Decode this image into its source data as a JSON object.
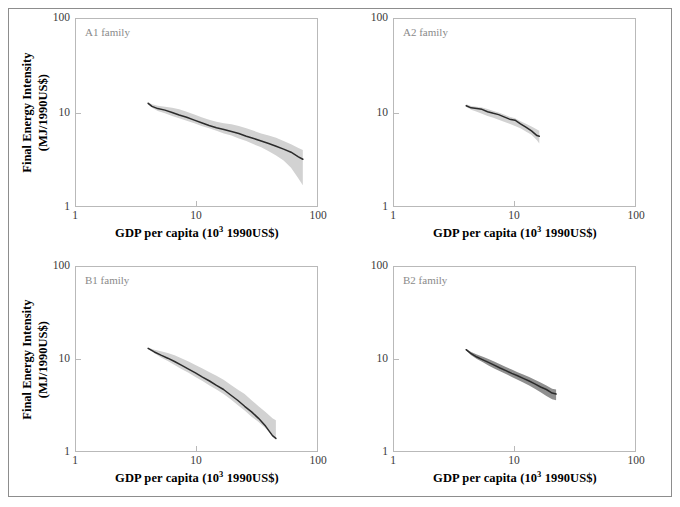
{
  "figure": {
    "axis_titles": {
      "x_main": "GDP per capita (10",
      "x_sup": "3",
      "x_tail": " 1990US$)",
      "y_line1": "Final Energy Intensity",
      "y_line2": "(MJ/1990US$)"
    },
    "tick_labels": {
      "x": [
        "1",
        "10",
        "100"
      ],
      "y": [
        "1",
        "10",
        "100"
      ]
    },
    "colors": {
      "band_light": "#d2d2d2",
      "band_dark": "#8f8f8f",
      "median_line": "#2b2b2b",
      "frame": "#b9b9b9",
      "panel_label": "#8a8a8a",
      "outer_border": "#8d8d8d"
    }
  },
  "chart_data": [
    {
      "type": "line",
      "title": "A1 family",
      "xlabel": "GDP per capita (10^3 1990US$)",
      "ylabel": "Final Energy Intensity (MJ/1990US$)",
      "xscale": "log",
      "yscale": "log",
      "xlim": [
        1,
        100
      ],
      "ylim": [
        1,
        100
      ],
      "xticks": [
        1,
        10,
        100
      ],
      "yticks": [
        1,
        10,
        100
      ],
      "grid": false,
      "legend": false,
      "band_color": "#d2d2d2",
      "series": [
        {
          "name": "median",
          "x": [
            4.0,
            4.3,
            4.8,
            5.5,
            6.3,
            7.2,
            8.3,
            9.6,
            11.0,
            12.7,
            14.6,
            16.8,
            19.4,
            22.3,
            25.7,
            29.6,
            34.1,
            39.3,
            45.2,
            52.1,
            60.0,
            69.0,
            75.0
          ],
          "values": [
            12.5,
            11.6,
            11.0,
            10.6,
            10.0,
            9.4,
            8.9,
            8.3,
            7.8,
            7.3,
            6.9,
            6.6,
            6.3,
            6.0,
            5.6,
            5.3,
            5.0,
            4.7,
            4.4,
            4.1,
            3.8,
            3.4,
            3.2
          ]
        },
        {
          "name": "upper",
          "x": [
            4.0,
            4.3,
            4.8,
            5.5,
            6.3,
            7.2,
            8.3,
            9.6,
            11.0,
            12.7,
            14.6,
            16.8,
            19.4,
            22.3,
            25.7,
            29.6,
            34.1,
            39.3,
            45.2,
            52.1,
            60.0,
            69.0,
            75.0
          ],
          "values": [
            12.8,
            12.2,
            11.8,
            11.5,
            11.2,
            10.8,
            10.2,
            9.5,
            8.9,
            8.4,
            8.0,
            7.7,
            7.5,
            7.2,
            6.8,
            6.4,
            6.0,
            5.7,
            5.4,
            5.0,
            4.6,
            4.2,
            4.0
          ]
        },
        {
          "name": "lower",
          "x": [
            4.0,
            4.3,
            4.8,
            5.5,
            6.3,
            7.2,
            8.3,
            9.6,
            11.0,
            12.7,
            14.6,
            16.8,
            19.4,
            22.3,
            25.7,
            29.6,
            34.1,
            39.3,
            45.2,
            52.1,
            60.0,
            69.0,
            75.0
          ],
          "values": [
            12.3,
            11.2,
            10.4,
            9.8,
            9.2,
            8.7,
            8.2,
            7.7,
            7.2,
            6.8,
            6.4,
            6.0,
            5.7,
            5.3,
            5.0,
            4.6,
            4.3,
            3.9,
            3.5,
            3.1,
            2.6,
            2.0,
            1.7
          ]
        }
      ]
    },
    {
      "type": "line",
      "title": "A2 family",
      "xlabel": "GDP per capita (10^3 1990US$)",
      "ylabel": "Final Energy Intensity (MJ/1990US$)",
      "xscale": "log",
      "yscale": "log",
      "xlim": [
        1,
        100
      ],
      "ylim": [
        1,
        100
      ],
      "xticks": [
        1,
        10,
        100
      ],
      "yticks": [
        1,
        10,
        100
      ],
      "grid": false,
      "legend": false,
      "band_color": "#d2d2d2",
      "series": [
        {
          "name": "median",
          "x": [
            4.0,
            4.4,
            4.9,
            5.4,
            6.0,
            6.7,
            7.4,
            8.2,
            9.1,
            10.1,
            11.2,
            12.4,
            13.8,
            15.3,
            16.0
          ],
          "values": [
            11.8,
            11.2,
            11.0,
            10.8,
            10.2,
            9.8,
            9.5,
            9.0,
            8.5,
            8.3,
            7.6,
            7.0,
            6.4,
            5.7,
            5.6
          ]
        },
        {
          "name": "upper",
          "x": [
            4.0,
            4.4,
            4.9,
            5.4,
            6.0,
            6.7,
            7.4,
            8.2,
            9.1,
            10.1,
            11.2,
            12.4,
            13.8,
            15.3,
            16.0
          ],
          "values": [
            12.2,
            11.7,
            11.5,
            11.3,
            10.9,
            10.4,
            10.0,
            9.5,
            9.0,
            8.7,
            8.1,
            7.6,
            7.1,
            6.6,
            6.4
          ]
        },
        {
          "name": "lower",
          "x": [
            4.0,
            4.4,
            4.9,
            5.4,
            6.0,
            6.7,
            7.4,
            8.2,
            9.1,
            10.1,
            11.2,
            12.4,
            13.8,
            15.3,
            16.0
          ],
          "values": [
            11.5,
            10.7,
            10.2,
            9.7,
            9.2,
            8.8,
            8.4,
            8.0,
            7.6,
            7.2,
            6.8,
            6.3,
            5.8,
            5.1,
            4.7
          ]
        }
      ]
    },
    {
      "type": "line",
      "title": "B1 family",
      "xlabel": "GDP per capita (10^3 1990US$)",
      "ylabel": "Final Energy Intensity (MJ/1990US$)",
      "xscale": "log",
      "yscale": "log",
      "xlim": [
        1,
        100
      ],
      "ylim": [
        1,
        100
      ],
      "xticks": [
        1,
        10,
        100
      ],
      "yticks": [
        1,
        10,
        100
      ],
      "grid": false,
      "legend": false,
      "band_color": "#d2d2d2",
      "series": [
        {
          "name": "median",
          "x": [
            4.0,
            4.5,
            5.1,
            5.8,
            6.6,
            7.5,
            8.6,
            9.8,
            11.2,
            12.8,
            14.6,
            16.7,
            19.1,
            21.8,
            24.9,
            28.4,
            32.4,
            37.0,
            42.2,
            45.0
          ],
          "values": [
            13.0,
            11.9,
            11.0,
            10.2,
            9.4,
            8.6,
            7.8,
            7.1,
            6.4,
            5.8,
            5.2,
            4.7,
            4.1,
            3.6,
            3.1,
            2.7,
            2.3,
            1.9,
            1.5,
            1.4
          ]
        },
        {
          "name": "upper",
          "x": [
            4.0,
            4.5,
            5.1,
            5.8,
            6.6,
            7.5,
            8.6,
            9.8,
            11.2,
            12.8,
            14.6,
            16.7,
            19.1,
            21.8,
            24.9,
            28.4,
            32.4,
            37.0,
            42.2,
            45.0
          ],
          "values": [
            13.2,
            12.6,
            12.1,
            11.6,
            11.0,
            10.2,
            9.4,
            8.6,
            7.9,
            7.2,
            6.6,
            6.0,
            5.3,
            4.7,
            4.2,
            3.6,
            3.1,
            2.7,
            2.3,
            2.2
          ]
        },
        {
          "name": "lower",
          "x": [
            4.0,
            4.5,
            5.1,
            5.8,
            6.6,
            7.5,
            8.6,
            9.8,
            11.2,
            12.8,
            14.6,
            16.7,
            19.1,
            21.8,
            24.9,
            28.4,
            32.4,
            37.0,
            42.2,
            45.0
          ],
          "values": [
            12.8,
            11.5,
            10.4,
            9.5,
            8.6,
            7.8,
            7.1,
            6.4,
            5.8,
            5.2,
            4.7,
            4.2,
            3.7,
            3.2,
            2.8,
            2.4,
            2.1,
            1.8,
            1.5,
            1.4
          ]
        }
      ]
    },
    {
      "type": "line",
      "title": "B2 family",
      "xlabel": "GDP per capita (10^3 1990US$)",
      "ylabel": "Final Energy Intensity (MJ/1990US$)",
      "xscale": "log",
      "yscale": "log",
      "xlim": [
        1,
        100
      ],
      "ylim": [
        1,
        100
      ],
      "xticks": [
        1,
        10,
        100
      ],
      "yticks": [
        1,
        10,
        100
      ],
      "grid": false,
      "legend": false,
      "band_color": "#8f8f8f",
      "series": [
        {
          "name": "median",
          "x": [
            4.0,
            4.4,
            4.9,
            5.5,
            6.1,
            6.8,
            7.6,
            8.5,
            9.5,
            10.6,
            11.8,
            13.2,
            14.7,
            16.4,
            18.3,
            20.4,
            22.0
          ],
          "values": [
            12.6,
            11.4,
            10.5,
            9.8,
            9.2,
            8.6,
            8.0,
            7.5,
            7.0,
            6.6,
            6.2,
            5.8,
            5.4,
            5.0,
            4.7,
            4.3,
            4.2
          ]
        },
        {
          "name": "upper",
          "x": [
            4.0,
            4.4,
            4.9,
            5.5,
            6.1,
            6.8,
            7.6,
            8.5,
            9.5,
            10.6,
            11.8,
            13.2,
            14.7,
            16.4,
            18.3,
            20.4,
            22.0
          ],
          "values": [
            12.8,
            11.9,
            11.2,
            10.6,
            10.0,
            9.4,
            8.8,
            8.2,
            7.7,
            7.2,
            6.8,
            6.4,
            6.0,
            5.6,
            5.2,
            4.8,
            4.7
          ]
        },
        {
          "name": "lower",
          "x": [
            4.0,
            4.4,
            4.9,
            5.5,
            6.1,
            6.8,
            7.6,
            8.5,
            9.5,
            10.6,
            11.8,
            13.2,
            14.7,
            16.4,
            18.3,
            20.4,
            22.0
          ],
          "values": [
            12.4,
            11.0,
            10.0,
            9.2,
            8.5,
            7.9,
            7.4,
            6.9,
            6.4,
            6.0,
            5.6,
            5.2,
            4.8,
            4.4,
            4.0,
            3.7,
            3.6
          ]
        }
      ]
    }
  ]
}
